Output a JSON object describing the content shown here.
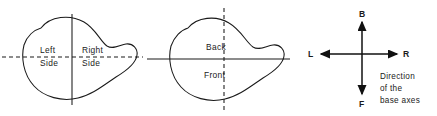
{
  "diagram": {
    "title": "Direction of the base axes",
    "stroke_color": "#1a1a1a",
    "background_color": "#ffffff",
    "panels": [
      {
        "id": "top-view",
        "name": "left-right-blob",
        "vertical_line_style": "solid",
        "horizontal_line_style": "dashed",
        "labels": [
          {
            "id": "left",
            "line1": "Left",
            "line2": "Side"
          },
          {
            "id": "right",
            "line1": "Right",
            "line2": "Side"
          }
        ]
      },
      {
        "id": "side-view",
        "name": "back-front-blob",
        "vertical_line_style": "dashed",
        "horizontal_line_style": "solid",
        "labels": [
          {
            "id": "back",
            "line1": "Back"
          },
          {
            "id": "front",
            "line1": "Front"
          }
        ]
      },
      {
        "id": "axes-key",
        "name": "base-axes-key",
        "axes": [
          {
            "id": "up",
            "label": "B",
            "meaning": "Back"
          },
          {
            "id": "down",
            "label": "F",
            "meaning": "Front"
          },
          {
            "id": "left",
            "label": "L",
            "meaning": "Left"
          },
          {
            "id": "right",
            "label": "R",
            "meaning": "Right"
          }
        ],
        "caption": {
          "line1": "Direction",
          "line2": "of the",
          "line3": "base axes"
        }
      }
    ]
  }
}
